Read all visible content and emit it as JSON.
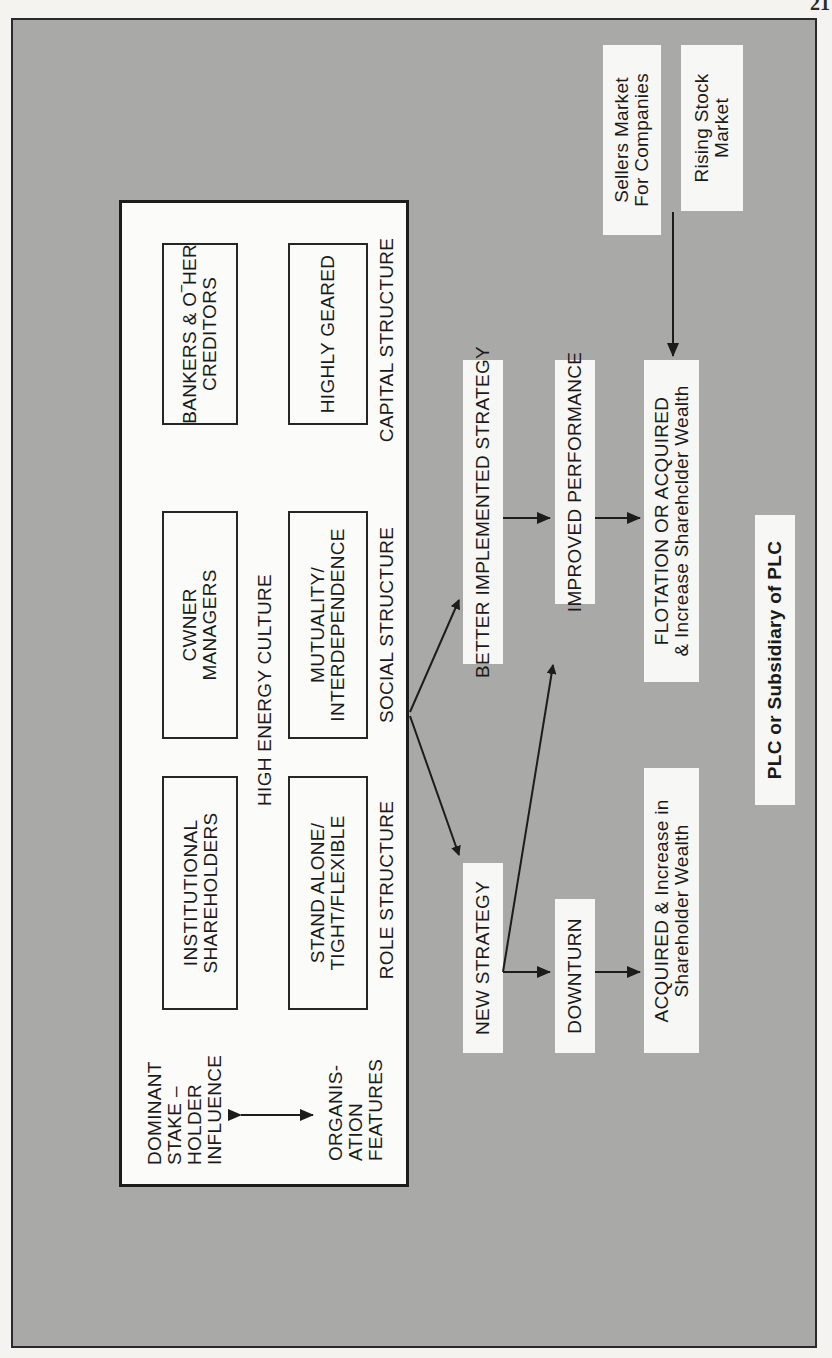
{
  "page": {
    "number_fragment": "21"
  },
  "diagram": {
    "orientation": "rotated -90deg (reads bottom-to-top)",
    "culture_panel": {
      "title": "HIGH ENERGY CULTURE",
      "row_header_top": "DOMINANT\nSTAKE –\nHOLDER\nINFLUENCE",
      "row_header_bottom": "ORGANIS-\nATION\nFEATURES",
      "stakeholder_boxes": [
        {
          "label": "INSTITUTIONAL\nSHAREHOLDERS"
        },
        {
          "label": "CWNER\nMANAGERS"
        },
        {
          "label": "BANKERS & O‾HER\nCREDITORS"
        }
      ],
      "feature_boxes": [
        {
          "label": "STAND ALONE/\nTIGHT/FLEXIBLE"
        },
        {
          "label": "MUTUALITY/\nINTERDEPENDENCE"
        },
        {
          "label": "HIGHLY GEARED"
        }
      ],
      "structure_labels": [
        {
          "label": "ROLE STRUCTURE"
        },
        {
          "label": "SOCIAL STRUCTURE"
        },
        {
          "label": "CAPITAL STRUCTURE"
        }
      ]
    },
    "flow": {
      "better_strategy": "BETTER IMPLEMENTED STRATEGY",
      "new_strategy": "NEW STRATEGY",
      "improved_performance": "IMPROVED PERFORMANCE",
      "downturn": "DOWNTURN",
      "flotation": "FLOTATION OR ACQUIRED\n& Increase Sharehclder Wealth",
      "acquired": "ACQUIRED & Increase in\nShareholder Wealth",
      "sellers_market": "Sellers Market\nFor Companies",
      "rising_stock": "Rising Stock\nMarket",
      "plc": "PLC or Subsidiary of PLC"
    },
    "edges": [
      {
        "from": "culture_panel",
        "to": "better_strategy"
      },
      {
        "from": "culture_panel",
        "to": "new_strategy"
      },
      {
        "from": "better_strategy",
        "to": "improved_performance"
      },
      {
        "from": "improved_performance",
        "to": "flotation"
      },
      {
        "from": "new_strategy",
        "to": "improved_performance"
      },
      {
        "from": "new_strategy",
        "to": "downturn"
      },
      {
        "from": "downturn",
        "to": "acquired"
      },
      {
        "from": "sellers_market",
        "to": "flotation"
      },
      {
        "from": "row_header_top",
        "to": "row_header_bottom",
        "bidirectional": true
      }
    ],
    "colors": {
      "background_panel": "#a9a9a7",
      "box_fill": "#fbfbfa",
      "line": "#1c1c1c"
    }
  }
}
